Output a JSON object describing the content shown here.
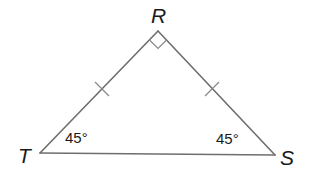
{
  "diagram": {
    "type": "triangle",
    "vertices": {
      "R": {
        "label": "R",
        "x": 158,
        "y": 31
      },
      "T": {
        "label": "T",
        "x": 40,
        "y": 153
      },
      "S": {
        "label": "S",
        "x": 275,
        "y": 155
      }
    },
    "right_angle_at": "R",
    "congruent_sides": [
      "RT",
      "RS"
    ],
    "angles": {
      "T": {
        "value": "45°"
      },
      "S": {
        "value": "45°"
      }
    },
    "colors": {
      "edge": "#6e6e6e",
      "text": "#1a1a1a"
    }
  }
}
